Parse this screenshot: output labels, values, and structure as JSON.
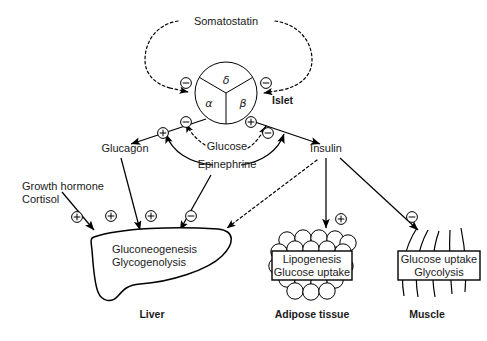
{
  "figure": {
    "background_color": "#ffffff",
    "line_color": "#000000",
    "text_color": "#1a1a1a"
  },
  "islet": {
    "label": "Islet",
    "cells": [
      {
        "name": "delta-cell",
        "symbol": "δ"
      },
      {
        "name": "alpha-cell",
        "symbol": "α"
      },
      {
        "name": "beta-cell",
        "symbol": "β"
      }
    ]
  },
  "hormones": {
    "somatostatin": "Somatostatin",
    "glucagon": "Glucagon",
    "glucose": "Glucose",
    "epinephrine": "Epinephrine",
    "insulin": "Insulin",
    "growth_hormone": "Growth hormone",
    "cortisol": "Cortisol"
  },
  "organs": [
    {
      "name": "liver",
      "label": "Liver",
      "processes": [
        "Gluconeogenesis",
        "Glycogenolysis"
      ]
    },
    {
      "name": "adipose-tissue",
      "label": "Adipose tissue",
      "processes": [
        "Lipogenesis",
        "Glucose uptake"
      ]
    },
    {
      "name": "muscle",
      "label": "Muscle",
      "processes": [
        "Glucose uptake",
        "Glycolysis"
      ]
    }
  ],
  "signs": {
    "plus": "⊕",
    "minus": "⊖"
  },
  "sign_markers": [
    {
      "id": "som-to-alpha",
      "type": "minus",
      "target": "alpha-cell"
    },
    {
      "id": "som-to-beta",
      "type": "minus",
      "target": "beta-cell"
    },
    {
      "id": "epi-to-alpha",
      "type": "plus",
      "target": "alpha-cell"
    },
    {
      "id": "glucose-to-alpha",
      "type": "minus",
      "target": "alpha-cell"
    },
    {
      "id": "epi-to-beta",
      "type": "plus",
      "target": "beta-cell"
    },
    {
      "id": "glucose-to-beta",
      "type": "minus",
      "target": "beta-cell"
    },
    {
      "id": "gh-cortisol-to-liver",
      "type": "plus",
      "target": "liver"
    },
    {
      "id": "glucagon-to-liver",
      "type": "plus",
      "target": "liver"
    },
    {
      "id": "epinephrine-to-liver",
      "type": "plus",
      "target": "liver"
    },
    {
      "id": "insulin-to-liver",
      "type": "minus",
      "target": "liver"
    },
    {
      "id": "insulin-to-adipose",
      "type": "plus",
      "target": "adipose-tissue"
    },
    {
      "id": "insulin-to-muscle",
      "type": "minus",
      "target": "muscle"
    }
  ]
}
